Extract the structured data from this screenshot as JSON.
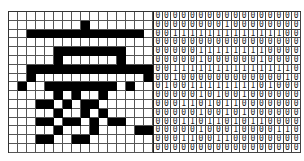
{
  "figure": {
    "colors": {
      "on": "#000000",
      "off": "#ffffff",
      "grid_line": "#555555"
    }
  },
  "matrix": [
    [
      0,
      0,
      0,
      0,
      0,
      0,
      0,
      0,
      0,
      0,
      0,
      0,
      0,
      0,
      0,
      0,
      0
    ],
    [
      0,
      0,
      0,
      0,
      0,
      0,
      0,
      0,
      1,
      0,
      0,
      0,
      0,
      0,
      0,
      0,
      0
    ],
    [
      0,
      0,
      1,
      1,
      1,
      1,
      1,
      1,
      1,
      1,
      1,
      1,
      1,
      1,
      1,
      0,
      0
    ],
    [
      0,
      0,
      0,
      0,
      0,
      0,
      0,
      0,
      0,
      0,
      0,
      0,
      0,
      0,
      0,
      0,
      0
    ],
    [
      0,
      0,
      0,
      0,
      0,
      1,
      1,
      1,
      1,
      1,
      1,
      1,
      1,
      0,
      0,
      0,
      0
    ],
    [
      0,
      0,
      0,
      0,
      0,
      1,
      0,
      0,
      0,
      0,
      0,
      0,
      1,
      0,
      0,
      0,
      0
    ],
    [
      0,
      0,
      1,
      1,
      1,
      1,
      1,
      1,
      1,
      1,
      1,
      1,
      1,
      1,
      1,
      1,
      0
    ],
    [
      0,
      0,
      1,
      0,
      0,
      0,
      0,
      0,
      0,
      0,
      0,
      0,
      0,
      0,
      0,
      1,
      0
    ],
    [
      0,
      1,
      0,
      0,
      1,
      1,
      1,
      1,
      1,
      1,
      1,
      1,
      0,
      1,
      0,
      0,
      0
    ],
    [
      0,
      0,
      0,
      0,
      0,
      1,
      0,
      1,
      0,
      0,
      1,
      0,
      0,
      0,
      0,
      0,
      0
    ],
    [
      0,
      0,
      0,
      1,
      1,
      0,
      1,
      0,
      1,
      1,
      0,
      0,
      0,
      0,
      0,
      0,
      0
    ],
    [
      0,
      0,
      0,
      0,
      0,
      1,
      0,
      0,
      1,
      0,
      1,
      0,
      0,
      0,
      0,
      0,
      0
    ],
    [
      0,
      0,
      0,
      1,
      1,
      0,
      1,
      1,
      0,
      1,
      0,
      1,
      1,
      0,
      0,
      0,
      0
    ],
    [
      0,
      0,
      0,
      0,
      0,
      1,
      0,
      0,
      0,
      1,
      0,
      0,
      0,
      0,
      1,
      1,
      0
    ],
    [
      0,
      0,
      0,
      1,
      1,
      0,
      0,
      1,
      1,
      0,
      0,
      0,
      0,
      0,
      0,
      0,
      0
    ],
    [
      0,
      0,
      0,
      0,
      0,
      0,
      0,
      0,
      0,
      0,
      0,
      0,
      0,
      0,
      0,
      0,
      0
    ]
  ],
  "pixel_grid_columns": 16
}
